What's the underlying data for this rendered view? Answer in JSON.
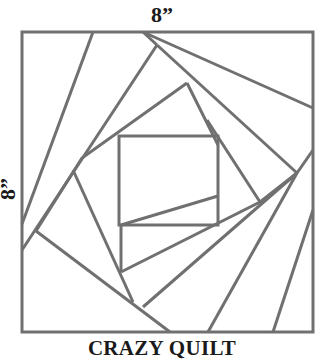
{
  "diagram": {
    "title": "CRAZY QUILT",
    "width_label": "8”",
    "height_label": "8”",
    "line_color": "#707070"
  }
}
